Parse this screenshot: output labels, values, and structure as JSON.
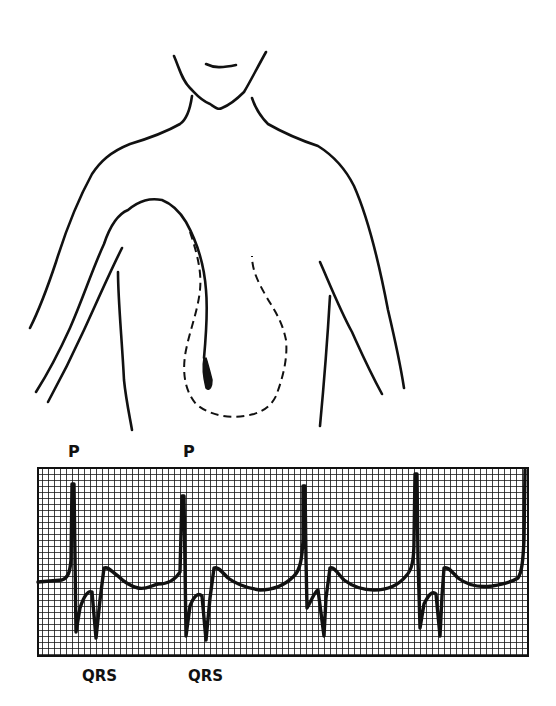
{
  "figure": {
    "type": "anatomical diagram with ECG strip",
    "illustration": {
      "subject": "upper torso outline",
      "features": [
        "neck and chin",
        "shoulders",
        "right arm",
        "catheter/pacing lead entering via arm into heart",
        "dashed outline of heart"
      ]
    },
    "ecg": {
      "labels_top": [
        {
          "text": "P"
        },
        {
          "text": "P"
        }
      ],
      "labels_bottom": [
        {
          "text": "QRS"
        },
        {
          "text": "QRS"
        }
      ],
      "beats": 4,
      "colors": {
        "ink": "#111111",
        "paper": "#ffffff"
      }
    }
  }
}
